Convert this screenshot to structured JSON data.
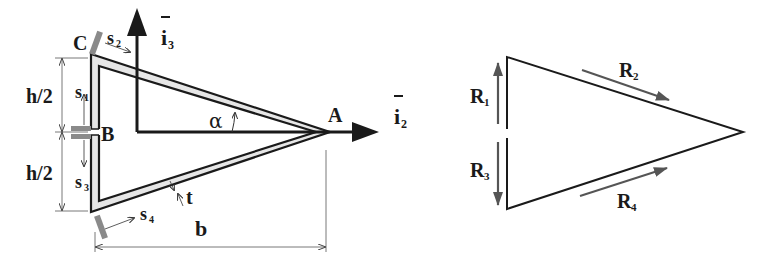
{
  "left_diagram": {
    "points": {
      "A": "A",
      "B": "B",
      "C": "C"
    },
    "axes": {
      "i2": "i",
      "i2_sub": "2",
      "i3": "i",
      "i3_sub": "3"
    },
    "angle": "α",
    "thickness": "t",
    "width": "b",
    "half_height_top": "h/2",
    "half_height_bottom": "h/2",
    "coords": {
      "s1": "s",
      "s1_sub": "1",
      "s2": "s",
      "s2_sub": "2",
      "s3": "s",
      "s3_sub": "3",
      "s4": "s",
      "s4_sub": "4"
    }
  },
  "right_diagram": {
    "R1": "R",
    "R1_sub": "1",
    "R2": "R",
    "R2_sub": "2",
    "R3": "R",
    "R3_sub": "3",
    "R4": "R",
    "R4_sub": "4"
  },
  "colors": {
    "line": "#1a1a1a",
    "wall_fill": "#e6e6e6",
    "cut_marker": "#8a8a8a",
    "dimension": "#555555",
    "flow_arrow": "#555555"
  }
}
